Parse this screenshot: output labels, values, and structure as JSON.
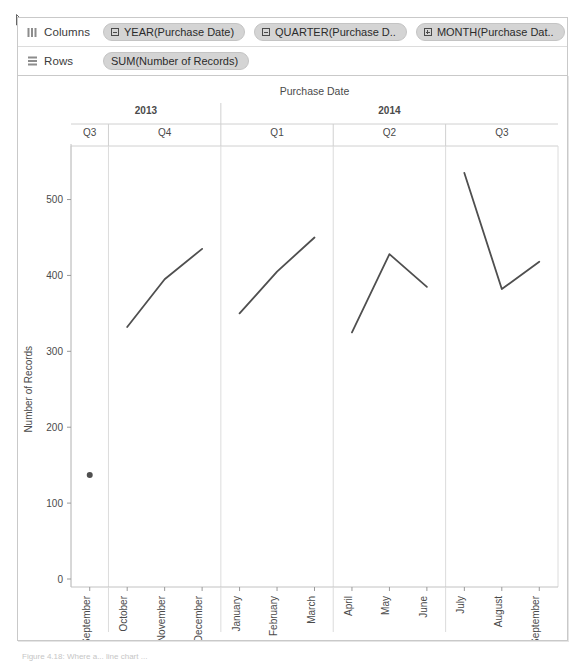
{
  "shelves": {
    "columns": {
      "label": "Columns",
      "icon": "columns-shelf-icon",
      "pills": [
        {
          "text": "YEAR(Purchase Date)",
          "glyph": "minus-box"
        },
        {
          "text": "QUARTER(Purchase D..",
          "glyph": "minus-box"
        },
        {
          "text": "MONTH(Purchase Dat..",
          "glyph": "plus-box"
        }
      ]
    },
    "rows": {
      "label": "Rows",
      "icon": "rows-shelf-icon",
      "pills": [
        {
          "text": "SUM(Number of Records)",
          "glyph": "none"
        }
      ]
    }
  },
  "caption": "Figure 4.18: Where a... line chart ...",
  "colors": {
    "line": "#4f4f4f",
    "axis": "#d0d0d0",
    "text": "#4a4a4a",
    "pill": "#d4d4d4",
    "frame": "#c9c9c9"
  },
  "chart_data": {
    "type": "line",
    "title": "Purchase Date",
    "xlabel": "",
    "ylabel": "Number of Records",
    "ylim": [
      0,
      560
    ],
    "yticks": [
      0,
      100,
      200,
      300,
      400,
      500
    ],
    "grid": false,
    "legend": false,
    "header_levels": [
      {
        "name": "year",
        "cells": [
          {
            "label": "2013",
            "span": 4
          },
          {
            "label": "2014",
            "span": 9
          }
        ]
      },
      {
        "name": "quarter",
        "cells": [
          {
            "label": "Q3",
            "span": 1
          },
          {
            "label": "Q4",
            "span": 3
          },
          {
            "label": "Q1",
            "span": 3
          },
          {
            "label": "Q2",
            "span": 3
          },
          {
            "label": "Q3",
            "span": 3
          }
        ]
      }
    ],
    "categories": [
      "September",
      "October",
      "November",
      "December",
      "January",
      "February",
      "March",
      "April",
      "May",
      "June",
      "July",
      "August",
      "September"
    ],
    "values": [
      137,
      332,
      395,
      435,
      350,
      405,
      450,
      325,
      428,
      385,
      535,
      382,
      418
    ],
    "series": [
      {
        "name": "SUM(Number of Records)",
        "values": [
          137,
          332,
          395,
          435,
          350,
          405,
          450,
          325,
          428,
          385,
          535,
          382,
          418
        ]
      }
    ],
    "segments": [
      {
        "quarter": "2013 Q3",
        "start_index": 0,
        "end_index": 0,
        "marker": "dot"
      },
      {
        "quarter": "2013 Q4",
        "start_index": 1,
        "end_index": 3,
        "marker": "line"
      },
      {
        "quarter": "2014 Q1",
        "start_index": 4,
        "end_index": 6,
        "marker": "line"
      },
      {
        "quarter": "2014 Q2",
        "start_index": 7,
        "end_index": 9,
        "marker": "line"
      },
      {
        "quarter": "2014 Q3",
        "start_index": 10,
        "end_index": 12,
        "marker": "line"
      }
    ]
  }
}
